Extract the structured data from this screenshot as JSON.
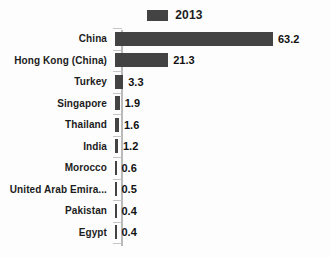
{
  "chart_data": {
    "type": "bar",
    "orientation": "horizontal",
    "title": "",
    "xlabel": "",
    "ylabel": "",
    "grid": false,
    "legend_position": "top-center",
    "axis_max": 63.2,
    "series": [
      {
        "name": "2013",
        "color": "#434343",
        "values": [
          63.2,
          21.3,
          3.3,
          1.9,
          1.6,
          1.2,
          0.6,
          0.5,
          0.4,
          0.4
        ]
      }
    ],
    "categories": [
      "China",
      "Hong Kong (China)",
      "Turkey",
      "Singapore",
      "Thailand",
      "India",
      "Morocco",
      "United Arab Emira...",
      "Pakistan",
      "Egypt"
    ],
    "value_labels": [
      "63.2",
      "21.3",
      "3.3",
      "1.9",
      "1.6",
      "1.2",
      "0.6",
      "0.5",
      "0.4",
      "0.4"
    ]
  },
  "legend": {
    "entries": [
      {
        "label": "2013",
        "color": "#434343"
      }
    ]
  },
  "colors": {
    "bar": "#434343",
    "axis": "#b9b9b9",
    "background": "#fdfdfd",
    "text": "#1c1c1c"
  }
}
